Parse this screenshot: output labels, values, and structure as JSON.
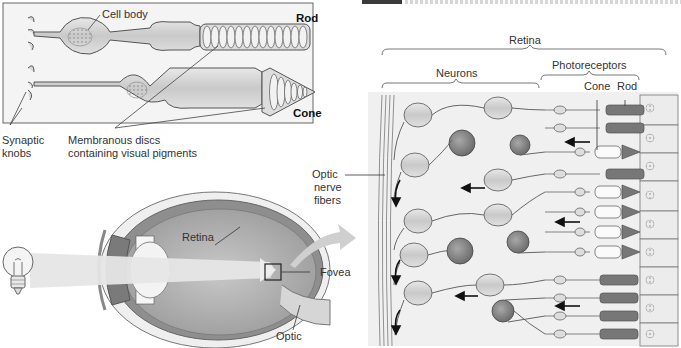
{
  "figure": {
    "top_left_panel": {
      "labels": {
        "cell_body": "Cell body",
        "rod": "Rod",
        "cone": "Cone",
        "synaptic_knobs_line1": "Synaptic",
        "synaptic_knobs_line2": "knobs",
        "discs_line1": "Membranous discs",
        "discs_line2": "containing visual pigments"
      }
    },
    "eye_panel": {
      "labels": {
        "retina": "Retina",
        "fovea": "Fovea",
        "optic": "Optic"
      }
    },
    "retina_panel": {
      "labels": {
        "retina": "Retina",
        "neurons": "Neurons",
        "photoreceptors": "Photoreceptors",
        "cone": "Cone",
        "rod": "Rod",
        "optic_nerve_line1": "Optic",
        "optic_nerve_line2": "nerve",
        "optic_nerve_line3": "fibers"
      }
    },
    "colors": {
      "cell_fill": "#d4d4d4",
      "dark_cell": "#8a8a8a",
      "outline": "#555555",
      "eye_outer": "#e6e6e6",
      "eye_inner": "#a8a8a8",
      "light_beam": "#ececec"
    }
  }
}
